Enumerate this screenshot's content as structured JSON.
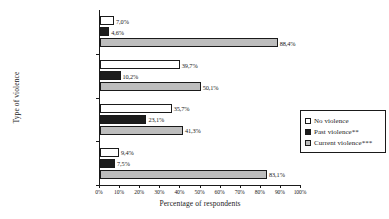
{
  "chart_data": {
    "type": "bar",
    "orientation": "horizontal",
    "title": "",
    "xlabel": "Percentage of respondents",
    "ylabel": "Type of violence",
    "xlim": [
      0,
      100
    ],
    "grid": false,
    "legend_position": "right",
    "xticks": [
      "0%",
      "10%",
      "20%",
      "30%",
      "40%",
      "50%",
      "60%",
      "70%",
      "80%",
      "90%",
      "100%"
    ],
    "xtick_values": [
      0,
      10,
      20,
      30,
      40,
      50,
      60,
      70,
      80,
      90,
      100
    ],
    "categories": [
      "Any type of violence*",
      "Sexual violence",
      "Physical violence",
      "Psycho violence"
    ],
    "series": [
      {
        "name": "No violence",
        "color": "#ffffff",
        "values": [
          7.0,
          39.7,
          35.7,
          9.4
        ],
        "labels": [
          "7,0%",
          "39,7%",
          "35,7%",
          "9,4%"
        ]
      },
      {
        "name": "Past violence**",
        "color": "#1c1c1c",
        "values": [
          4.6,
          10.2,
          23.1,
          7.5
        ],
        "labels": [
          "4,6%",
          "10,2%",
          "23,1%",
          "7,5%"
        ]
      },
      {
        "name": "Current violence***",
        "color": "#bdbdbd",
        "values": [
          88.4,
          50.1,
          41.3,
          83.1
        ],
        "labels": [
          "88,4%",
          "50,1%",
          "41,3%",
          "83,1%"
        ]
      }
    ]
  },
  "legend": {
    "items": [
      {
        "label": "No violence"
      },
      {
        "label": "Past violence**"
      },
      {
        "label": "Current violence***"
      }
    ]
  }
}
